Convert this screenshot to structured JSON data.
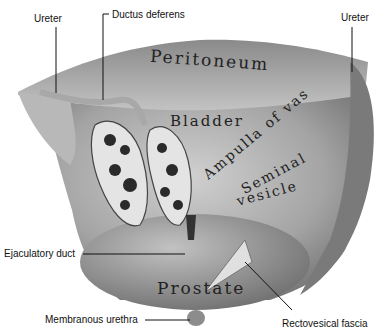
{
  "figure": {
    "type": "anatomical-illustration",
    "colors": {
      "background": "#ffffff",
      "tissue_light": "#c8c8c8",
      "tissue_mid": "#9a9a9a",
      "tissue_dark": "#555555",
      "leader_line": "#111111"
    }
  },
  "labels": {
    "ureter_left": "Ureter",
    "ductus_deferens": "Ductus deferens",
    "ureter_right": "Ureter",
    "ejaculatory_duct": "Ejaculatory duct",
    "membranous_urethra": "Membranous urethra",
    "rectovesical_fascia": "Rectovesical fascia"
  },
  "organ_text": {
    "peritoneum": "Peritoneum",
    "bladder": "Bladder",
    "ampulla": "Ampulla of vas",
    "seminal": "Seminal",
    "vesicle": "vesicle",
    "prostate": "Prostate"
  }
}
